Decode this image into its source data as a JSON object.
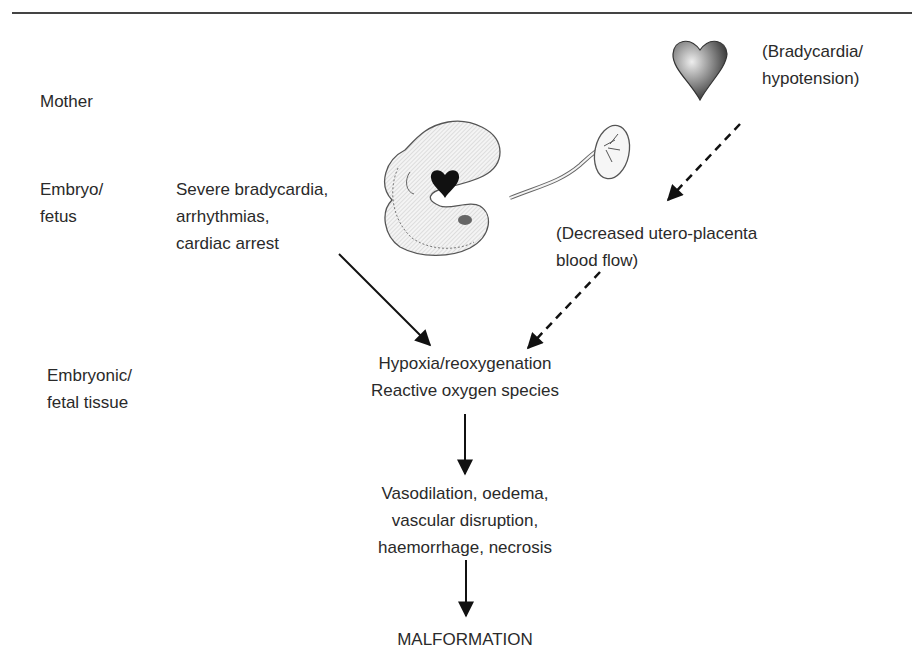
{
  "diagram": {
    "row_labels": {
      "mother": "Mother",
      "embryo": "Embryo/\nfetus",
      "tissue": "Embryonic/\nfetal tissue"
    },
    "nodes": {
      "maternal_cause": "(Bradycardia/\nhypotension)",
      "fetal_cause": "Severe bradycardia,\narrhythmias,\ncardiac arrest",
      "placental_flow": "(Decreased utero-placenta\nblood flow)",
      "hypoxia": "Hypoxia/reoxygenation\nReactive oxygen species",
      "vascular_effects": "Vasodilation, oedema,\nvascular disruption,\nhaemorrhage, necrosis",
      "outcome": "MALFORMATION"
    },
    "icons": {
      "maternal_heart": "heart-icon",
      "embryo": "embryo-illustration",
      "placenta": "placenta-illustration"
    },
    "edges": [
      {
        "from": "maternal_cause",
        "to": "placental_flow",
        "style": "dashed"
      },
      {
        "from": "placental_flow",
        "to": "hypoxia",
        "style": "dashed"
      },
      {
        "from": "fetal_cause",
        "to": "hypoxia",
        "style": "solid"
      },
      {
        "from": "hypoxia",
        "to": "vascular_effects",
        "style": "solid"
      },
      {
        "from": "vascular_effects",
        "to": "outcome",
        "style": "solid"
      }
    ],
    "colors": {
      "text": "#2a2a2a",
      "arrow": "#111111",
      "rule": "#444444"
    }
  }
}
